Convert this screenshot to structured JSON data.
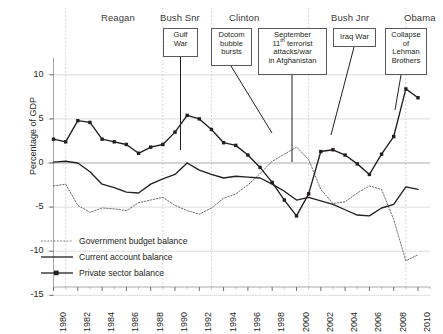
{
  "chart_data": {
    "type": "line",
    "title": "",
    "xlabel": "",
    "ylabel": "Percentage of GDP",
    "ylim": [
      -15,
      13
    ],
    "xlim": [
      1980,
      2011
    ],
    "yticks": [
      10,
      5,
      0,
      -5,
      -10,
      -15
    ],
    "ytick_labels": [
      "10",
      "5",
      "0",
      "-5",
      "-10",
      "-15"
    ],
    "xticks": [
      1980,
      1982,
      1984,
      1986,
      1988,
      1990,
      1992,
      1994,
      1996,
      1998,
      2000,
      2002,
      2004,
      2006,
      2008,
      2010
    ],
    "xtick_labels": [
      "1980",
      "1982",
      "1984",
      "1986",
      "1988",
      "1990",
      "1992",
      "1994",
      "1996",
      "1998",
      "2000",
      "2002",
      "2004",
      "2006",
      "2008",
      "2010"
    ],
    "grid": "horizontal-and-era-dividers",
    "legend_position": "lower-left-inside",
    "x": [
      1980,
      1981,
      1982,
      1983,
      1984,
      1985,
      1986,
      1987,
      1988,
      1989,
      1990,
      1991,
      1992,
      1993,
      1994,
      1995,
      1996,
      1997,
      1998,
      1999,
      2000,
      2001,
      2002,
      2003,
      2004,
      2005,
      2006,
      2007,
      2008,
      2009,
      2010
    ],
    "series": [
      {
        "name": "Government budget balance",
        "style": "dotted",
        "color": "#6d6e71",
        "values": [
          -2.6,
          -2.4,
          -4.8,
          -5.6,
          -5.1,
          -5.2,
          -5.4,
          -4.5,
          -4.2,
          -3.9,
          -4.8,
          -5.4,
          -5.8,
          -5.1,
          -4.0,
          -3.5,
          -2.5,
          -1.2,
          0.2,
          1.0,
          1.8,
          0.4,
          -3.0,
          -4.6,
          -4.4,
          -3.4,
          -2.6,
          -3.0,
          -6.4,
          -11.1,
          -10.4
        ]
      },
      {
        "name": "Current account balance",
        "style": "solid",
        "color": "#231f20",
        "values": [
          0.1,
          0.2,
          0.0,
          -1.0,
          -2.4,
          -2.8,
          -3.3,
          -3.4,
          -2.4,
          -1.8,
          -1.3,
          0.0,
          -0.8,
          -1.3,
          -1.7,
          -1.5,
          -1.6,
          -1.7,
          -2.4,
          -3.2,
          -4.2,
          -3.9,
          -4.3,
          -4.7,
          -5.3,
          -5.9,
          -6.0,
          -5.1,
          -4.7,
          -2.7,
          -3.0
        ]
      },
      {
        "name": "Private sector balance",
        "style": "solid-markers",
        "color": "#231f20",
        "values": [
          2.7,
          2.4,
          4.8,
          4.6,
          2.7,
          2.4,
          2.1,
          1.1,
          1.8,
          2.1,
          3.5,
          5.4,
          5.0,
          3.8,
          2.3,
          2.0,
          0.9,
          -0.5,
          -2.2,
          -4.2,
          -6.0,
          -3.5,
          1.3,
          1.5,
          0.9,
          -0.1,
          -1.3,
          1.0,
          3.0,
          8.4,
          7.4
        ]
      }
    ],
    "eras": [
      {
        "label": "Reagan",
        "start": 1981,
        "end": 1989
      },
      {
        "label": "Bush Snr",
        "start": 1989,
        "end": 1993
      },
      {
        "label": "Clinton",
        "start": 1993,
        "end": 2001
      },
      {
        "label": "Bush Jnr",
        "start": 2001,
        "end": 2009
      },
      {
        "label": "Obama",
        "start": 2009,
        "end": 2011
      }
    ],
    "annotations": [
      {
        "label": "Gulf War",
        "lines": [
          "Gulf",
          "War"
        ],
        "year": 1990.6,
        "target_value": 3.6
      },
      {
        "label": "Dotcom bubble bursts",
        "lines": [
          "Dotcom",
          "bubble",
          "bursts"
        ],
        "year": 2000.2,
        "target_value": -3.0
      },
      {
        "label": "September 11th terrorist attacks/war in Afghanistan",
        "lines": [
          "September",
          "11<sup>th</sup> terrorist",
          "attacks/war",
          "in Afghanistan"
        ],
        "year": 2001.5,
        "target_value": 0.2
      },
      {
        "label": "Iraq War",
        "lines": [
          "Iraq War"
        ],
        "year": 2003.2,
        "target_value": 1.4
      },
      {
        "label": "Collapse of Lehman Brothers",
        "lines": [
          "Collapse",
          "of",
          "Lehman",
          "Brothers"
        ],
        "year": 2008.6,
        "target_value": 6.0
      }
    ]
  },
  "axis": {
    "ylabel": "Percentage of GDP",
    "yticks": [
      "10",
      "5",
      "0",
      "-5",
      "-10",
      "-15"
    ],
    "xticks": [
      "1980",
      "1982",
      "1984",
      "1986",
      "1988",
      "1990",
      "1992",
      "1994",
      "1996",
      "1998",
      "2000",
      "2002",
      "2004",
      "2006",
      "2008",
      "2010"
    ]
  },
  "eras": {
    "items": [
      {
        "label": "Reagan"
      },
      {
        "label": "Bush Snr"
      },
      {
        "label": "Clinton"
      },
      {
        "label": "Bush Jnr"
      },
      {
        "label": "Obama"
      }
    ]
  },
  "annotations": {
    "gulf_war": {
      "line1": "Gulf",
      "line2": "War"
    },
    "dotcom": {
      "line1": "Dotcom",
      "line2": "bubble",
      "line3": "bursts"
    },
    "sept11": {
      "line1": "September",
      "line2_pre": "11",
      "line2_sup": "th",
      "line2_post": " terrorist",
      "line3": "attacks/war",
      "line4": "in Afghanistan"
    },
    "iraq_war": {
      "line1": "Iraq War"
    },
    "lehman": {
      "line1": "Collapse",
      "line2": "of",
      "line3": "Lehman",
      "line4": "Brothers"
    }
  },
  "legend": {
    "items": [
      {
        "label": "Government budget balance"
      },
      {
        "label": "Current account balance"
      },
      {
        "label": "Private sector balance"
      }
    ]
  }
}
